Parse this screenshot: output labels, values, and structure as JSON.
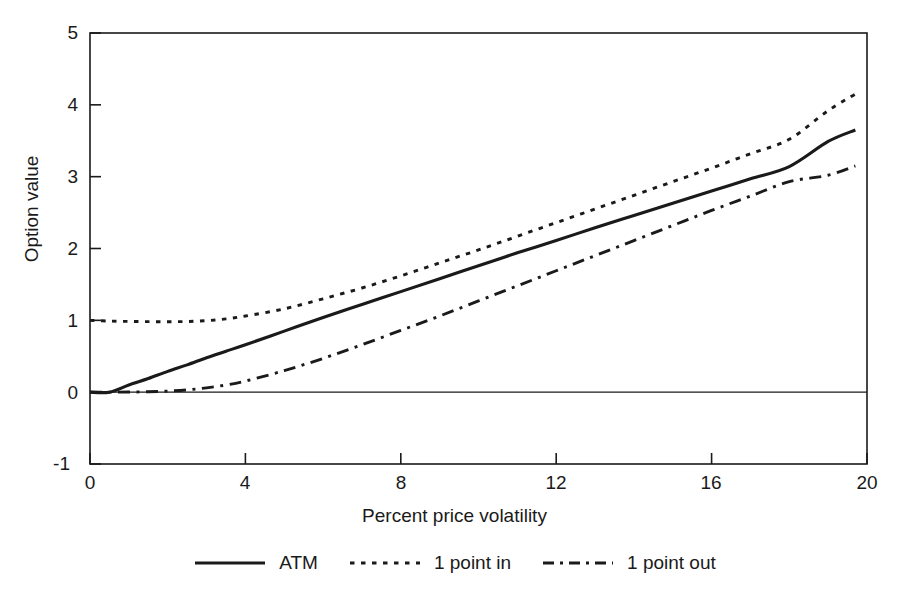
{
  "figure": {
    "background": "#ffffff",
    "ink_color": "#1a1a1a"
  },
  "chart_data": {
    "type": "line",
    "title": "",
    "xlabel": "Percent price volatility",
    "ylabel": "Option value",
    "xlim": [
      0,
      20
    ],
    "ylim": [
      -1,
      5
    ],
    "xticks": [
      0,
      4,
      8,
      12,
      16,
      20
    ],
    "yticks": [
      -1,
      0,
      1,
      2,
      3,
      4,
      5
    ],
    "xtick_labels": [
      "0",
      "4",
      "8",
      "12",
      "16",
      "20"
    ],
    "ytick_labels": [
      "-1",
      "0",
      "1",
      "2",
      "3",
      "4",
      "5"
    ],
    "grid": false,
    "zero_reference_line": 0,
    "legend_position": "below-axes",
    "x": [
      0,
      0.5,
      1,
      1.5,
      2,
      2.5,
      3,
      3.5,
      4,
      5,
      6,
      7,
      8,
      9,
      10,
      11,
      12,
      13,
      14,
      15,
      16,
      17,
      18,
      19,
      19.7
    ],
    "series": [
      {
        "name": "ATM",
        "style": "solid",
        "color": "#1a1a1a",
        "values": [
          0,
          0,
          0.1,
          0.19,
          0.29,
          0.38,
          0.48,
          0.57,
          0.66,
          0.85,
          1.04,
          1.22,
          1.4,
          1.58,
          1.76,
          1.94,
          2.11,
          2.29,
          2.46,
          2.63,
          2.8,
          2.97,
          3.14,
          3.49,
          3.65
        ]
      },
      {
        "name": "1 point in",
        "style": "dotted",
        "color": "#1a1a1a",
        "values": [
          1.0,
          0.99,
          0.985,
          0.982,
          0.981,
          0.984,
          0.995,
          1.02,
          1.06,
          1.16,
          1.3,
          1.45,
          1.62,
          1.8,
          1.98,
          2.17,
          2.36,
          2.55,
          2.74,
          2.93,
          3.12,
          3.32,
          3.52,
          3.92,
          4.15
        ]
      },
      {
        "name": "1 point out",
        "style": "dashdot",
        "color": "#1a1a1a",
        "values": [
          0,
          0,
          0.002,
          0.006,
          0.015,
          0.032,
          0.06,
          0.1,
          0.155,
          0.3,
          0.47,
          0.66,
          0.86,
          1.06,
          1.27,
          1.48,
          1.69,
          1.9,
          2.11,
          2.32,
          2.53,
          2.73,
          2.93,
          3.02,
          3.15
        ]
      }
    ]
  },
  "legend": {
    "items": [
      {
        "label": "ATM",
        "style": "solid"
      },
      {
        "label": "1 point in",
        "style": "dotted"
      },
      {
        "label": "1 point out",
        "style": "dashdot"
      }
    ]
  }
}
